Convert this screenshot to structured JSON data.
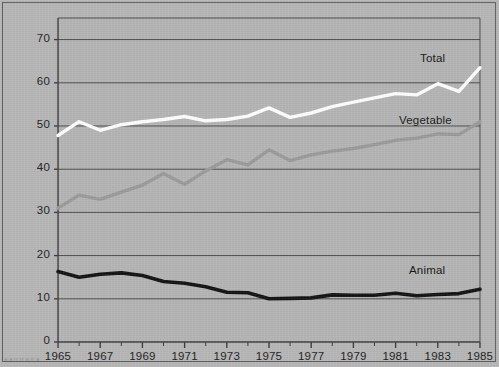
{
  "figure": {
    "background_color": "#b6b6b6",
    "frame_color": "#5d5d5d",
    "caption_fragment": "a a rr  rr a  rr a"
  },
  "chart_data": {
    "type": "line",
    "title": "",
    "xlabel": "",
    "ylabel": "",
    "xlim": [
      1965,
      1985
    ],
    "ylim": [
      0,
      75
    ],
    "yticks": [
      0,
      10,
      20,
      30,
      40,
      50,
      60,
      70
    ],
    "xticks": [
      1965,
      1967,
      1969,
      1971,
      1973,
      1975,
      1977,
      1979,
      1981,
      1983,
      1985
    ],
    "xtick_minor_step": 1,
    "grid": "horizontal",
    "legend": "inline-right-labels",
    "x": [
      1965,
      1966,
      1967,
      1968,
      1969,
      1970,
      1971,
      1972,
      1973,
      1974,
      1975,
      1976,
      1977,
      1978,
      1979,
      1980,
      1981,
      1982,
      1983,
      1984,
      1985
    ],
    "series": [
      {
        "name": "Total",
        "color": "#ffffff",
        "label": "Total",
        "values": [
          47.8,
          51.0,
          49.0,
          50.3,
          51.0,
          51.5,
          52.2,
          51.2,
          51.5,
          52.3,
          54.2,
          52.0,
          53.0,
          54.5,
          55.5,
          56.5,
          57.5,
          57.2,
          59.8,
          58.0,
          63.5
        ]
      },
      {
        "name": "Vegetable",
        "color": "#9a9a9a",
        "label": "Vegetable",
        "values": [
          31.0,
          34.0,
          33.0,
          34.7,
          36.3,
          39.0,
          36.5,
          39.6,
          42.2,
          41.0,
          44.5,
          42.0,
          43.3,
          44.2,
          44.8,
          45.7,
          46.7,
          47.2,
          48.2,
          48.0,
          51.0
        ]
      },
      {
        "name": "Animal",
        "color": "#111111",
        "label": "Animal",
        "values": [
          16.3,
          15.0,
          15.7,
          16.0,
          15.4,
          14.0,
          13.6,
          12.8,
          11.5,
          11.4,
          10.0,
          10.1,
          10.2,
          10.9,
          10.8,
          10.8,
          11.3,
          10.7,
          11.0,
          11.2,
          12.2
        ]
      }
    ]
  },
  "ytick_labels": [
    "0",
    "10",
    "20",
    "30",
    "40",
    "50",
    "60",
    "70"
  ],
  "xtick_labels": [
    "1965",
    "1967",
    "1969",
    "1971",
    "1973",
    "1975",
    "1977",
    "1979",
    "1981",
    "1983",
    "1985"
  ],
  "series_labels": {
    "total": "Total",
    "vegetable": "Vegetable",
    "animal": "Animal"
  }
}
